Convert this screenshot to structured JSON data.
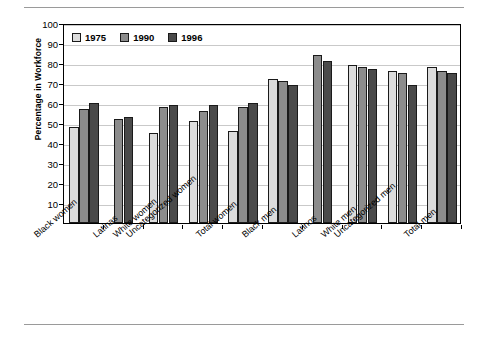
{
  "chart_data": {
    "type": "bar",
    "title": "",
    "xlabel": "",
    "ylabel": "Percentage in Workforce",
    "ylim": [
      0,
      100
    ],
    "ytick_values": [
      0,
      10,
      20,
      30,
      40,
      50,
      60,
      70,
      80,
      90,
      100
    ],
    "ytick_labels": [
      "",
      "10",
      "20",
      "30",
      "40",
      "50",
      "60",
      "70",
      "80",
      "90",
      "100"
    ],
    "grid": "horizontal",
    "legend_position": "top-left-inside",
    "categories": [
      "Black women",
      "Latinas",
      "White women",
      "Uncategorized women",
      "Total women",
      "Black men",
      "Latinos",
      "White men",
      "Uncategorized men",
      "Total men"
    ],
    "series": [
      {
        "name": "1975",
        "color": "#dcdcdc",
        "values": [
          48,
          null,
          45,
          51,
          46,
          72,
          null,
          79,
          76,
          78
        ]
      },
      {
        "name": "1990",
        "color": "#8c8c8c",
        "values": [
          57,
          52,
          58,
          56,
          58,
          71,
          84,
          78,
          75,
          76
        ]
      },
      {
        "name": "1996",
        "color": "#4a4a4a",
        "values": [
          60,
          53,
          59,
          59,
          60,
          69,
          81,
          77,
          69,
          75
        ]
      }
    ]
  },
  "legend": {
    "items": [
      {
        "label": "1975",
        "swatch": "legend-swatch-1975"
      },
      {
        "label": "1990",
        "swatch": "legend-swatch-1990"
      },
      {
        "label": "1996",
        "swatch": "legend-swatch-1996"
      }
    ]
  }
}
